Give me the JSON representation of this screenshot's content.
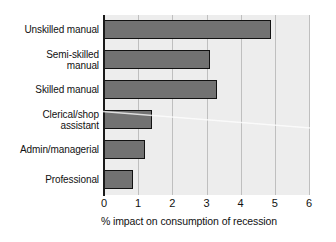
{
  "chart_data": {
    "type": "bar",
    "orientation": "horizontal",
    "title": "",
    "subtitle": "",
    "xlabel": "% impact on consumption of recession",
    "ylabel": "",
    "categories": [
      "Unskilled manual",
      "Semi-skilled manual",
      "Skilled manual",
      "Clerical/shop assistant",
      "Admin/managerial",
      "Professional"
    ],
    "category_lines": [
      [
        "Unskilled manual"
      ],
      [
        "Semi-skilled",
        "manual"
      ],
      [
        "Skilled manual"
      ],
      [
        "Clerical/shop",
        "assistant"
      ],
      [
        "Admin/managerial"
      ],
      [
        "Professional"
      ]
    ],
    "values": [
      4.9,
      3.1,
      3.3,
      1.4,
      1.2,
      0.85
    ],
    "xlim": [
      0,
      6
    ],
    "xticks": [
      0,
      1,
      2,
      3,
      4,
      5,
      6
    ],
    "xtick_labels": [
      "0",
      "1",
      "2",
      "3",
      "4",
      "5",
      "6"
    ],
    "grid": "vertical",
    "legend": "none",
    "bar_color": "#727272",
    "bar_edge_color": "#121212",
    "plot_background": "#ededed",
    "axis_color": "#1a1a1a",
    "gridline_color": "#bfbfbf"
  }
}
